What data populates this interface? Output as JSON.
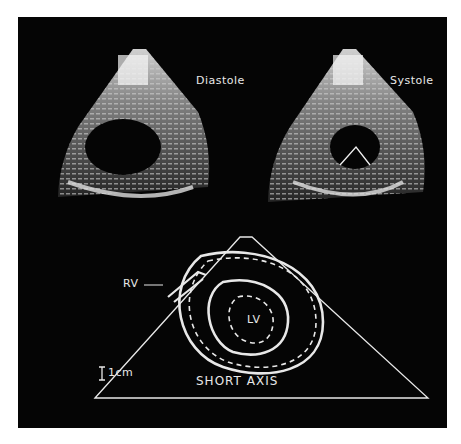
{
  "figure": {
    "panels": [
      {
        "id": "diastole",
        "label": "Diastole"
      },
      {
        "id": "systole",
        "label": "Systole"
      }
    ],
    "diagram": {
      "title": "SHORT AXIS",
      "scale_label": "1cm",
      "labels": {
        "rv": "RV",
        "lv": "LV"
      }
    },
    "colors": {
      "background": "#050505",
      "line": "#e8e8e8",
      "page": "#ffffff"
    }
  }
}
